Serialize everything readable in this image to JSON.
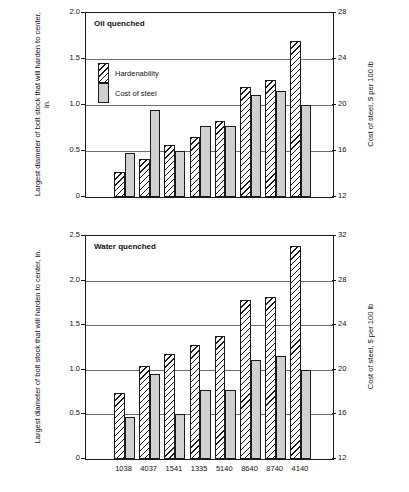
{
  "chart_data": [
    {
      "type": "bar",
      "title": "Oil quenched",
      "categories": [
        "1038",
        "4037",
        "1541",
        "1335",
        "5140",
        "8640",
        "8740",
        "4140"
      ],
      "series": [
        {
          "name": "Hardenability",
          "axis": "left",
          "values": [
            0.27,
            0.41,
            0.56,
            0.65,
            0.83,
            1.2,
            1.27,
            1.7
          ]
        },
        {
          "name": "Cost of steel",
          "axis": "right",
          "values": [
            15.8,
            19.6,
            16.0,
            18.2,
            18.2,
            20.9,
            21.2,
            20.0
          ]
        }
      ],
      "ylabel": "Largest diameter of bolt stock that will harden to center, in.",
      "ylabel_right": "Cost of steel, $ per 100 lb",
      "xlabel": "",
      "ylim": [
        0,
        2.0
      ],
      "yticks": [
        "0",
        "0.5",
        "1.0",
        "1.5",
        "2.0"
      ],
      "ylim_right": [
        12,
        28
      ],
      "yticks_right": [
        "12",
        "16",
        "20",
        "24",
        "28"
      ],
      "grid": true,
      "legend": [
        "Hardenability",
        "Cost of steel"
      ]
    },
    {
      "type": "bar",
      "title": "Water quenched",
      "categories": [
        "1038",
        "4037",
        "1541",
        "1335",
        "5140",
        "8640",
        "8740",
        "4140"
      ],
      "series": [
        {
          "name": "Hardenability",
          "axis": "left",
          "values": [
            0.74,
            1.04,
            1.18,
            1.28,
            1.38,
            1.78,
            1.82,
            2.39
          ]
        },
        {
          "name": "Cost of steel",
          "axis": "right",
          "values": [
            15.8,
            19.6,
            16.0,
            18.2,
            18.2,
            20.9,
            21.2,
            20.0
          ]
        }
      ],
      "ylabel": "Largest diameter of bolt stock that will harden to center, in.",
      "ylabel_right": "Cost of steel, $ per 100 lb",
      "xlabel": "",
      "ylim": [
        0,
        2.5
      ],
      "yticks": [
        "0",
        "0.5",
        "1.0",
        "1.5",
        "2.0",
        "2.5"
      ],
      "ylim_right": [
        12,
        32
      ],
      "yticks_right": [
        "12",
        "16",
        "20",
        "24",
        "28",
        "32"
      ],
      "grid": true,
      "legend": [
        "Hardenability",
        "Cost of steel"
      ]
    }
  ],
  "oil": {
    "caption": "Oil quenched",
    "axis_left_title": "Largest diameter of bolt stock that will harden to center, in.",
    "axis_right_title": "Cost of steel, $ per 100 lb",
    "yticks": [
      "2.0",
      "1.5",
      "1.0",
      "0.5",
      "0"
    ],
    "yticks_right": [
      "28",
      "24",
      "20",
      "16",
      "12"
    ],
    "legend": {
      "hardenability": "Hardenability",
      "cost": "Cost of steel"
    }
  },
  "water": {
    "caption": "Water quenched",
    "axis_left_title": "Largest diameter of bolt stock that will harden to center, in.",
    "axis_right_title": "Cost of steel, $ per 100 lb",
    "yticks": [
      "2.5",
      "2.0",
      "1.5",
      "1.0",
      "0.5",
      "0"
    ],
    "yticks_right": [
      "32",
      "28",
      "24",
      "20",
      "16",
      "12"
    ],
    "xticks": [
      "1038",
      "4037",
      "1541",
      "1335",
      "5140",
      "8640",
      "8740",
      "4140"
    ]
  },
  "colors": {
    "axis": "#1a1a1a",
    "grid": "#6e6e6e",
    "cost_fill": "#d0d0d0",
    "background": "#ffffff"
  }
}
